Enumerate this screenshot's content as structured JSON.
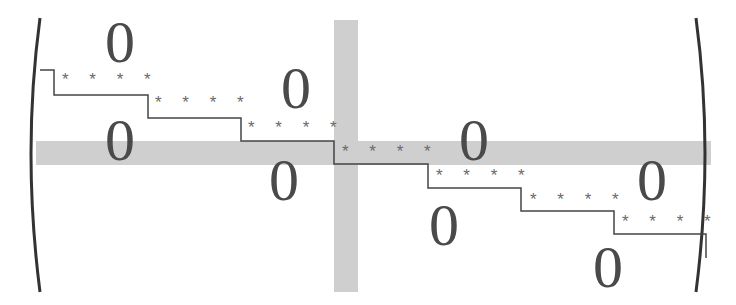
{
  "diagram": {
    "zero_symbol": "0",
    "star_block": "* * * *",
    "colors": {
      "band": "#cfcfcf",
      "ink": "#4a4a4a",
      "stars": "#6a6a6a"
    },
    "zeros": [
      {
        "x": 120,
        "y": 12
      },
      {
        "x": 296,
        "y": 58
      },
      {
        "x": 120,
        "y": 110
      },
      {
        "x": 474,
        "y": 110
      },
      {
        "x": 284,
        "y": 150
      },
      {
        "x": 652,
        "y": 150
      },
      {
        "x": 444,
        "y": 195
      },
      {
        "x": 608,
        "y": 237
      }
    ],
    "star_rows": [
      {
        "x": 62,
        "y": 70
      },
      {
        "x": 155,
        "y": 93
      },
      {
        "x": 248,
        "y": 118
      },
      {
        "x": 342,
        "y": 142
      },
      {
        "x": 436,
        "y": 166
      },
      {
        "x": 530,
        "y": 190
      },
      {
        "x": 622,
        "y": 212
      }
    ]
  }
}
